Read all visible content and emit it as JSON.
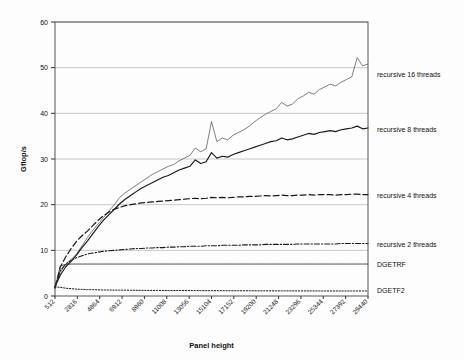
{
  "chart_data": {
    "type": "line",
    "title": "",
    "xlabel": "Panel height",
    "ylabel": "Gflop/s",
    "ylim": [
      0,
      60
    ],
    "yticks": [
      0,
      10,
      20,
      30,
      40,
      50,
      60
    ],
    "grid": true,
    "legend_position": "right-outside",
    "xtick_labels": [
      "512",
      "2816",
      "4864",
      "6912",
      "8960",
      "11008",
      "13056",
      "15104",
      "17152",
      "19200",
      "21248",
      "23296",
      "25344",
      "27392",
      "29440"
    ],
    "x": [
      512,
      1024,
      1536,
      2048,
      2560,
      3072,
      3584,
      4096,
      4608,
      5120,
      5632,
      6144,
      6656,
      7168,
      7680,
      8192,
      8704,
      9216,
      9728,
      10240,
      10752,
      11264,
      11776,
      12288,
      12800,
      13312,
      13824,
      14336,
      14848,
      15360,
      15872,
      16384,
      16896,
      17408,
      17920,
      18432,
      18944,
      19456,
      19968,
      20480,
      20992,
      21504,
      22016,
      22528,
      23040,
      23552,
      24064,
      24576,
      25088,
      25600,
      26112,
      26624,
      27136,
      27648,
      28160,
      28672,
      29184,
      29696,
      30208
    ],
    "series": [
      {
        "name": "recursive 16 threads",
        "style": "solid-thin",
        "color": "#555555",
        "label_y_value": 48.5,
        "values": [
          2.0,
          5.2,
          7.0,
          8.0,
          9.2,
          11.0,
          12.8,
          14.4,
          15.8,
          17.2,
          18.6,
          20.0,
          21.6,
          22.6,
          23.4,
          24.2,
          25.0,
          25.8,
          26.6,
          27.2,
          27.8,
          28.4,
          28.8,
          29.6,
          30.2,
          30.8,
          32.4,
          31.6,
          32.2,
          38.2,
          33.8,
          34.6,
          34.2,
          35.2,
          35.8,
          36.4,
          37.2,
          38.2,
          39.0,
          39.8,
          40.4,
          41.0,
          42.4,
          41.6,
          42.0,
          43.2,
          43.8,
          44.6,
          44.2,
          45.2,
          45.8,
          46.4,
          46.0,
          46.8,
          47.4,
          48.0,
          52.2,
          50.4,
          50.8
        ]
      },
      {
        "name": "recursive 8 threads",
        "style": "solid-thick",
        "color": "#1a1a1a",
        "label_y_value": 36.5,
        "values": [
          2.0,
          4.6,
          6.4,
          7.6,
          9.0,
          10.6,
          12.0,
          13.6,
          15.2,
          16.6,
          17.8,
          19.0,
          20.2,
          21.2,
          22.0,
          22.8,
          23.6,
          24.2,
          24.8,
          25.4,
          26.0,
          26.4,
          27.0,
          27.6,
          28.0,
          28.4,
          29.8,
          29.0,
          29.4,
          31.4,
          30.2,
          30.6,
          30.4,
          31.0,
          31.4,
          31.8,
          32.2,
          32.6,
          33.0,
          33.4,
          33.8,
          34.0,
          34.6,
          34.2,
          34.4,
          34.8,
          35.2,
          35.6,
          35.4,
          35.8,
          36.0,
          36.2,
          36.0,
          36.4,
          36.6,
          36.8,
          37.2,
          36.6,
          36.8
        ]
      },
      {
        "name": "recursive 4 threads",
        "style": "dashed",
        "color": "#1a1a1a",
        "label_y_value": 22.0,
        "values": [
          2.0,
          6.4,
          8.6,
          10.4,
          12.0,
          13.2,
          14.2,
          15.4,
          16.6,
          17.6,
          18.4,
          19.0,
          19.4,
          19.8,
          20.0,
          20.2,
          20.4,
          20.5,
          20.6,
          20.7,
          20.8,
          20.9,
          21.0,
          21.1,
          21.2,
          21.3,
          21.4,
          21.3,
          21.4,
          21.6,
          21.5,
          21.6,
          21.5,
          21.6,
          21.7,
          21.7,
          21.8,
          21.8,
          21.9,
          22.0,
          21.9,
          22.0,
          22.1,
          22.0,
          22.0,
          22.1,
          22.1,
          22.2,
          22.1,
          22.2,
          22.2,
          22.2,
          22.1,
          22.2,
          22.2,
          22.3,
          22.3,
          22.2,
          22.2
        ]
      },
      {
        "name": "recursive 2 threads",
        "style": "dash-dot",
        "color": "#1a1a1a",
        "label_y_value": 11.2,
        "values": [
          1.8,
          5.6,
          7.0,
          7.8,
          8.4,
          8.8,
          9.2,
          9.4,
          9.6,
          9.8,
          9.9,
          10.0,
          10.1,
          10.2,
          10.3,
          10.4,
          10.4,
          10.5,
          10.5,
          10.6,
          10.6,
          10.7,
          10.7,
          10.8,
          10.8,
          10.9,
          10.9,
          10.9,
          11.0,
          11.0,
          11.0,
          11.1,
          11.1,
          11.1,
          11.1,
          11.2,
          11.2,
          11.2,
          11.2,
          11.3,
          11.3,
          11.3,
          11.3,
          11.3,
          11.3,
          11.4,
          11.4,
          11.4,
          11.4,
          11.4,
          11.4,
          11.4,
          11.4,
          11.5,
          11.5,
          11.5,
          11.5,
          11.5,
          11.5
        ]
      },
      {
        "name": "DGETRF",
        "style": "solid-flat",
        "color": "#333333",
        "label_y_value": 7.0,
        "values": [
          1.6,
          6.6,
          6.9,
          7.0,
          7.0,
          7.0,
          7.0,
          7.0,
          7.0,
          7.0,
          7.0,
          7.0,
          7.0,
          7.0,
          7.0,
          7.0,
          7.0,
          7.0,
          7.0,
          7.0,
          7.0,
          7.0,
          7.0,
          7.0,
          7.0,
          7.0,
          7.0,
          7.0,
          7.0,
          7.0,
          7.0,
          7.0,
          7.0,
          7.0,
          7.0,
          7.0,
          7.0,
          7.0,
          7.0,
          7.0,
          7.0,
          7.0,
          7.0,
          7.0,
          7.0,
          7.0,
          7.0,
          7.0,
          7.0,
          7.0,
          7.0,
          7.0,
          7.0,
          7.0,
          7.0,
          7.0,
          7.0,
          7.0,
          7.0
        ]
      },
      {
        "name": "DGETF2",
        "style": "dotted",
        "color": "#1a1a1a",
        "label_y_value": 1.2,
        "values": [
          2.0,
          1.9,
          1.7,
          1.6,
          1.5,
          1.45,
          1.4,
          1.38,
          1.35,
          1.32,
          1.3,
          1.29,
          1.28,
          1.27,
          1.26,
          1.25,
          1.24,
          1.23,
          1.22,
          1.22,
          1.21,
          1.2,
          1.2,
          1.2,
          1.19,
          1.19,
          1.18,
          1.18,
          1.17,
          1.17,
          1.16,
          1.16,
          1.15,
          1.15,
          1.15,
          1.14,
          1.14,
          1.14,
          1.13,
          1.13,
          1.13,
          1.12,
          1.12,
          1.12,
          1.12,
          1.11,
          1.11,
          1.11,
          1.11,
          1.1,
          1.1,
          1.1,
          1.1,
          1.1,
          1.1,
          1.1,
          1.1,
          1.1,
          1.1
        ]
      }
    ]
  },
  "legend": {
    "items": [
      {
        "label": "recursive 16 threads"
      },
      {
        "label": "recursive 8 threads"
      },
      {
        "label": "recursive 4 threads"
      },
      {
        "label": "recursive 2 threads"
      },
      {
        "label": "DGETRF"
      },
      {
        "label": "DGETF2"
      }
    ]
  },
  "axes": {
    "y_title": "Gflop/s",
    "x_title": "Panel height"
  },
  "colors": {
    "grid": "#b9b9b9",
    "frame": "#555555",
    "text": "#111111",
    "background": "#fdfdfd"
  }
}
